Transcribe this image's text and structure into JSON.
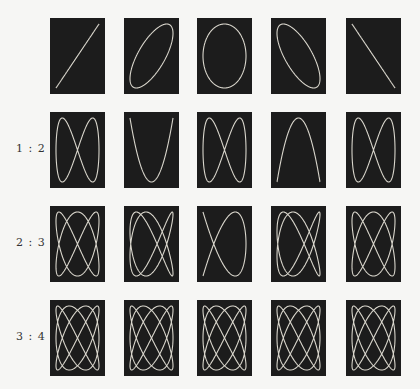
{
  "figure": {
    "title": "",
    "colors": {
      "background": "#f6f6f4",
      "panel": "#1c1c1c",
      "trace": "#d9d6cc",
      "label": "#333333"
    },
    "columns_x": [
      50,
      124,
      197,
      271,
      346
    ],
    "panel_size": {
      "width": 55,
      "height": 76
    },
    "phases_deg": [
      0,
      45,
      90,
      135,
      180
    ],
    "rows": [
      {
        "label": "",
        "ratio": [
          1,
          1
        ],
        "y": 18
      },
      {
        "label": "1 : 2",
        "ratio": [
          1,
          2
        ],
        "y": 112
      },
      {
        "label": "2 : 3",
        "ratio": [
          2,
          3
        ],
        "y": 206
      },
      {
        "label": "3 : 4",
        "ratio": [
          3,
          4
        ],
        "y": 300
      }
    ]
  }
}
